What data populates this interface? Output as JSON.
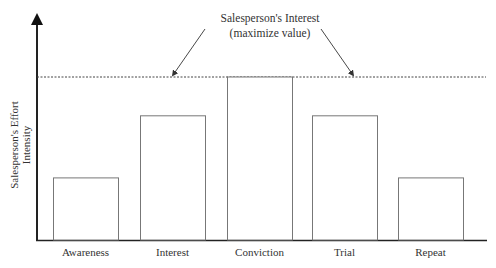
{
  "chart_data": {
    "type": "bar",
    "title": "",
    "xlabel": "",
    "ylabel": "Salesperson's Effort Intensity",
    "ylabel_lines": [
      "Salesperson's Effort",
      "Intensity"
    ],
    "categories": [
      "Awareness",
      "Interest",
      "Conviction",
      "Trial",
      "Repeat"
    ],
    "values": [
      2,
      4,
      5.25,
      4,
      2
    ],
    "ylim": [
      0,
      7.5
    ],
    "grid": false,
    "axis_ticks": false,
    "reference_line": {
      "value": 5.25,
      "style": "dotted",
      "label_lines": [
        "Salesperson's Interest",
        "(maximize value)"
      ]
    },
    "legend": null
  },
  "colors": {
    "axis": "#222222",
    "bar_stroke": "#777777",
    "bar_fill": "#ffffff",
    "reference_line": "#444444",
    "text": "#333333"
  }
}
